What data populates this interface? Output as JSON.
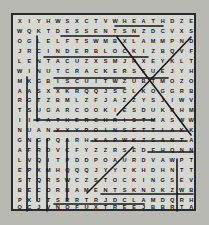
{
  "puzzle": {
    "kind": "word-search",
    "rows": 19,
    "cols": 19,
    "ink_color": "#16161a",
    "paper_color": "#d8d8d2",
    "page_color": "#b9b9b4",
    "border_color": "#2a2a2a",
    "grid": [
      [
        "X",
        "I",
        "Y",
        "H",
        "W",
        "S",
        "X",
        "C",
        "T",
        "V",
        "W",
        "H",
        "E",
        "A",
        "T",
        "H",
        "D",
        "Z",
        "E"
      ],
      [
        "W",
        "Q",
        "K",
        "T",
        "D",
        "E",
        "S",
        "S",
        "E",
        "N",
        "T",
        "S",
        "N",
        "Z",
        "D",
        "C",
        "V",
        "X",
        "S"
      ],
      [
        "O",
        "G",
        "L",
        "E",
        "L",
        "F",
        "T",
        "S",
        "W",
        "M",
        "B",
        "X",
        "L",
        "A",
        "M",
        "M",
        "P",
        "N",
        "D"
      ],
      [
        "J",
        "R",
        "C",
        "I",
        "N",
        "D",
        "E",
        "R",
        "B",
        "L",
        "O",
        "C",
        "K",
        "I",
        "Z",
        "B",
        "Q",
        "V",
        "F"
      ],
      [
        "L",
        "E",
        "N",
        "T",
        "A",
        "C",
        "U",
        "Z",
        "X",
        "S",
        "M",
        "J",
        "R",
        "X",
        "E",
        "Y",
        "K",
        "L",
        "T"
      ],
      [
        "W",
        "I",
        "N",
        "U",
        "T",
        "C",
        "R",
        "A",
        "C",
        "K",
        "E",
        "R",
        "S",
        "F",
        "U",
        "E",
        "J",
        "Y",
        "H"
      ],
      [
        "M",
        "K",
        "G",
        "B",
        "I",
        "S",
        "C",
        "U",
        "I",
        "T",
        "W",
        "Z",
        "U",
        "B",
        "T",
        "M",
        "O",
        "Z",
        "O"
      ],
      [
        "A",
        "A",
        "S",
        "X",
        "X",
        "K",
        "R",
        "Q",
        "Q",
        "J",
        "S",
        "C",
        "L",
        "K",
        "O",
        "G",
        "G",
        "R",
        "B"
      ],
      [
        "R",
        "G",
        "T",
        "Z",
        "B",
        "M",
        "L",
        "Z",
        "F",
        "J",
        "A",
        "Z",
        "Z",
        "Y",
        "S",
        "J",
        "I",
        "W",
        "V"
      ],
      [
        "T",
        "S",
        "U",
        "G",
        "A",
        "R",
        "C",
        "O",
        "O",
        "K",
        "I",
        "E",
        "S",
        "D",
        "U",
        "K",
        "R",
        "H",
        "M"
      ],
      [
        "I",
        "I",
        "F",
        "A",
        "T",
        "H",
        "E",
        "R",
        "C",
        "H",
        "R",
        "I",
        "S",
        "T",
        "M",
        "A",
        "S",
        "W",
        "W"
      ],
      [
        "N",
        "U",
        "A",
        "N",
        "X",
        "X",
        "Y",
        "P",
        "O",
        "I",
        "N",
        "S",
        "E",
        "T",
        "T",
        "I",
        "A",
        "K",
        "K"
      ],
      [
        "G",
        "N",
        "G",
        "P",
        "Q",
        "A",
        "R",
        "H",
        "K",
        "A",
        "P",
        "W",
        "K",
        "Z",
        "S",
        "A",
        "N",
        "T",
        "A"
      ],
      [
        "A",
        "F",
        "R",
        "D",
        "V",
        "C",
        "F",
        "Y",
        "Z",
        "Z",
        "R",
        "S",
        "E",
        "D",
        "F",
        "H",
        "Q",
        "N",
        "N"
      ],
      [
        "L",
        "V",
        "Q",
        "I",
        "T",
        "P",
        "D",
        "D",
        "P",
        "O",
        "A",
        "U",
        "R",
        "D",
        "V",
        "A",
        "W",
        "P",
        "T"
      ],
      [
        "E",
        "P",
        "X",
        "M",
        "H",
        "Q",
        "Q",
        "Q",
        "J",
        "Y",
        "Y",
        "T",
        "K",
        "H",
        "D",
        "H",
        "N",
        "T",
        "T"
      ],
      [
        "S",
        "T",
        "Q",
        "R",
        "S",
        "W",
        "C",
        "Z",
        "S",
        "T",
        "O",
        "C",
        "K",
        "I",
        "N",
        "G",
        "S",
        "E",
        "V"
      ],
      [
        "B",
        "E",
        "C",
        "O",
        "R",
        "N",
        "A",
        "M",
        "E",
        "N",
        "T",
        "S",
        "K",
        "N",
        "D",
        "K",
        "Z",
        "W",
        "B"
      ],
      [
        "P",
        "K",
        "J",
        "T",
        "S",
        "R",
        "R",
        "T",
        "R",
        "J",
        "D",
        "C",
        "L",
        "A",
        "M",
        "D",
        "Q",
        "R",
        "H"
      ]
    ],
    "last_row": [
      "O",
      "C",
      "J",
      "V",
      "N",
      "O",
      "F",
      "U",
      "X",
      "T",
      "R",
      "E",
      "E",
      "J",
      "B",
      "B",
      "R",
      "T",
      "A"
    ],
    "found_words": [
      {
        "word": "WHEAT",
        "direction": "horizontal",
        "row": 1,
        "start_col": 11,
        "end_col": 15
      },
      {
        "word": "DESSERTS",
        "direction": "horizontal",
        "row": 2,
        "start_col": 5,
        "end_col": 12
      },
      {
        "word": "CINDERBLOCK",
        "direction": "horizontal",
        "row": 4,
        "start_col": 3,
        "end_col": 13
      },
      {
        "word": "NUTCRACKERS",
        "direction": "horizontal",
        "row": 6,
        "start_col": 4,
        "end_col": 15
      },
      {
        "word": "BISCUIT",
        "direction": "horizontal",
        "row": 7,
        "start_col": 4,
        "end_col": 11
      },
      {
        "word": "SUGARCOOKIES",
        "direction": "horizontal",
        "row": 10,
        "start_col": 2,
        "end_col": 14
      },
      {
        "word": "FATHERCHRISTMAS",
        "direction": "horizontal",
        "row": 11,
        "start_col": 4,
        "end_col": 17
      },
      {
        "word": "POINSETTIA",
        "direction": "horizontal",
        "row": 12,
        "start_col": 8,
        "end_col": 17
      },
      {
        "word": "SANTA",
        "direction": "horizontal",
        "row": 13,
        "start_col": 14,
        "end_col": 18
      },
      {
        "word": "STOCKINGS",
        "direction": "horizontal",
        "row": 17,
        "start_col": 9,
        "end_col": 18
      },
      {
        "word": "ORNAMENTS",
        "direction": "horizontal",
        "row": 18,
        "start_col": 4,
        "end_col": 13
      },
      {
        "word": "TREE",
        "direction": "horizontal",
        "row": 19,
        "start_col": 10,
        "end_col": 14
      },
      {
        "word": "VERTICAL-LEFT-1",
        "direction": "vertical",
        "col": 1,
        "start_row": 6,
        "end_row": 19
      },
      {
        "word": "VERTICAL-LEFT-2",
        "direction": "vertical",
        "col": 2,
        "start_row": 2,
        "end_row": 10
      },
      {
        "word": "VERTICAL-MID-1",
        "direction": "vertical",
        "col": 3,
        "start_row": 12,
        "end_row": 19
      },
      {
        "word": "VERTICAL-MID-2",
        "direction": "vertical",
        "col": 2,
        "start_row": 12,
        "end_row": 18
      },
      {
        "word": "VERTICAL-MID-3",
        "direction": "vertical",
        "col": 5,
        "start_row": 12,
        "end_row": 18
      },
      {
        "word": "VERTICAL-RIGHT",
        "direction": "vertical",
        "col": 16,
        "start_row": 14,
        "end_row": 19
      },
      {
        "word": "DIAGONAL-DOWN-RIGHT",
        "direction": "diagonal-down-right",
        "start_row": 2,
        "start_col": 11,
        "end_row": 11,
        "end_col": 19
      },
      {
        "word": "DIAGONAL-UP-RIGHT-1",
        "direction": "diagonal-up-right",
        "start_row": 9,
        "start_col": 11,
        "end_row": 2,
        "end_col": 17
      },
      {
        "word": "DIAGONAL-UP-RIGHT-2",
        "direction": "diagonal-up-right",
        "start_row": 17,
        "start_col": 8,
        "end_row": 13,
        "end_col": 12
      }
    ]
  }
}
